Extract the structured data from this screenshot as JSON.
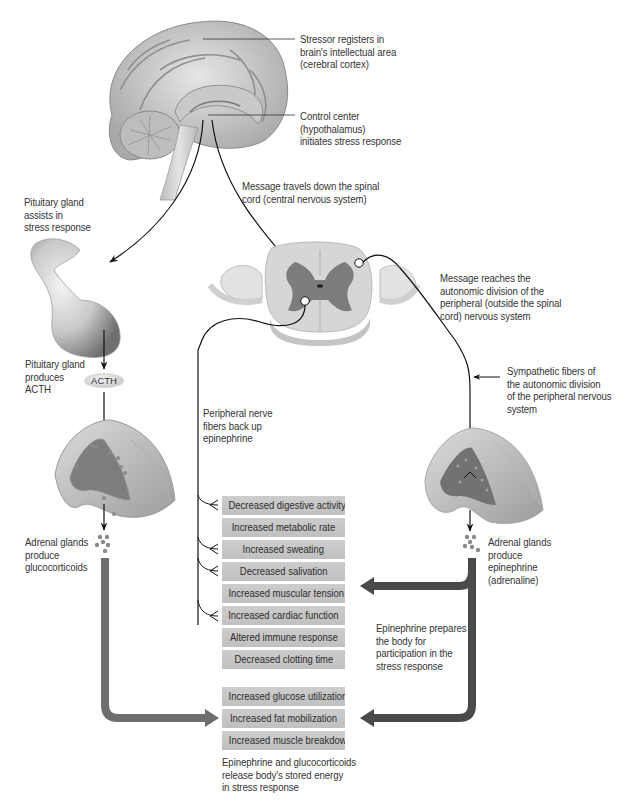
{
  "diagram": {
    "labels": {
      "stressor": [
        "Stressor registers in",
        "brain's intellectual area",
        "(cerebral cortex)"
      ],
      "control_center": [
        "Control center",
        "(hypothalamus)",
        "initiates stress response"
      ],
      "message_spinal": [
        "Message travels down the spinal",
        "cord (central nervous system)"
      ],
      "pituitary_assists": [
        "Pituitary gland",
        "assists in",
        "stress response"
      ],
      "pituitary_produces": [
        "Pituitary gland",
        "produces",
        "ACTH"
      ],
      "acth": "ACTH",
      "message_autonomic": [
        "Message reaches the",
        "autonomic division of the",
        "peripheral (outside the spinal",
        "cord) nervous system"
      ],
      "sympathetic": [
        "Sympathetic fibers of",
        "the autonomic division",
        "of the peripheral nervous",
        "system"
      ],
      "peripheral_nerve": [
        "Peripheral nerve",
        "fibers back up",
        "epinephrine"
      ],
      "adrenal_gluco": [
        "Adrenal glands",
        "produce",
        "glucocorticoids"
      ],
      "adrenal_epi": [
        "Adrenal glands",
        "produce",
        "epinephrine",
        "(adrenaline)"
      ],
      "epi_prepares": [
        "Epinephrine prepares",
        "the body for",
        "participation in the",
        "stress response"
      ],
      "energy_release": [
        "Epinephrine and glucocorticoids",
        "release body's stored energy",
        "in stress response"
      ]
    },
    "effects_epinephrine": [
      "Decreased digestive activity",
      "Increased metabolic rate",
      "Increased sweating",
      "Decreased salivation",
      "Increased muscular tension",
      "Increased cardiac function",
      "Altered immune response",
      "Decreased clotting time"
    ],
    "effects_energy": [
      "Increased glucose utilization",
      "Increased fat mobilization",
      "Increased muscle breakdown"
    ],
    "colors": {
      "box_fill": "#c6c6c6",
      "thick_arrow_dark": "#4a4a4a",
      "thick_arrow_mid": "#6e6e6e",
      "nerve_line": "#111111",
      "gray_matter": "#7c7c7c",
      "white_matter": "#d8d8d8"
    }
  }
}
